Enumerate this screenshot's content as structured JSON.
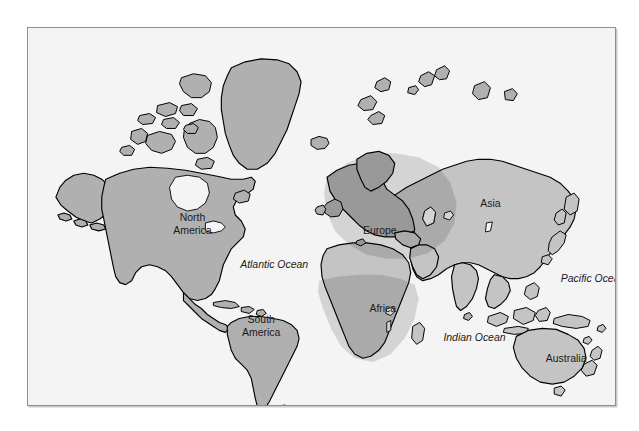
{
  "figure": {
    "type": "world-map",
    "kind": "political outline map, gray landmasses on light background",
    "frame": {
      "background_color": "#f4f4f4",
      "border_color": "#8e8e8e",
      "shadow_color": "#c9c9c9"
    },
    "colors": {
      "land": "#b0b0b0",
      "land_light": "#c4c4c4",
      "outline": "#000000",
      "shaded_overlay": "rgba(0,0,0,0.13)",
      "label_text": "#1a1a1a",
      "page_background": "#ffffff"
    }
  },
  "labels": {
    "continents": [
      {
        "name": "north-america",
        "line1": "North",
        "line2": "America",
        "x": 165,
        "y": 197,
        "style": "upright"
      },
      {
        "name": "south-america",
        "line1": "South",
        "line2": "America",
        "x": 234,
        "y": 300,
        "style": "upright"
      },
      {
        "name": "europe",
        "line1": "Europe",
        "line2": "",
        "x": 353,
        "y": 204,
        "style": "upright"
      },
      {
        "name": "africa",
        "line1": "Africa",
        "line2": "",
        "x": 356,
        "y": 283,
        "style": "upright"
      },
      {
        "name": "asia",
        "line1": "Asia",
        "line2": "",
        "x": 464,
        "y": 177,
        "style": "upright"
      },
      {
        "name": "australia",
        "line1": "Australia",
        "line2": "",
        "x": 540,
        "y": 333,
        "style": "upright"
      }
    ],
    "oceans": [
      {
        "name": "atlantic-ocean",
        "text": "Atlantic Ocean",
        "x": 247,
        "y": 239,
        "style": "italic"
      },
      {
        "name": "pacific-ocean",
        "text": "Pacific Ocean",
        "x": 567,
        "y": 253,
        "style": "italic"
      },
      {
        "name": "indian-ocean",
        "text": "Indian Ocean",
        "x": 448,
        "y": 312,
        "style": "italic"
      }
    ]
  },
  "shaded_regions": [
    {
      "name": "europe-west-asia-shading",
      "description": "darker gray overlay across Europe and western Asia with curved eastern edge"
    },
    {
      "name": "sub-saharan-africa-shading",
      "description": "darker gray overlay across Africa below the Sahara line"
    }
  ]
}
